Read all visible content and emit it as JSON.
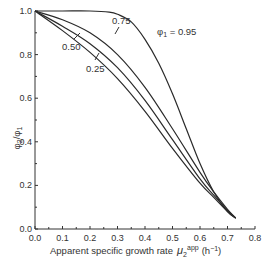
{
  "chart_data": {
    "type": "line",
    "title": "",
    "xlabel": "Apparent specific growth rate μ2^app (h^-1)",
    "xlabel_main": "Apparent specific growth rate",
    "xlabel_symbol": "μ",
    "xlabel_sub": "2",
    "xlabel_sup": "app",
    "xlabel_units": "(h",
    "xlabel_units_sup": "−1",
    "xlabel_units_close": ")",
    "ylabel": "φ2/φ1",
    "ylabel_main": "φ",
    "ylabel_sub1": "2",
    "ylabel_slash": "/φ",
    "ylabel_sub2": "1",
    "xlim": [
      0.0,
      0.8
    ],
    "ylim": [
      0.0,
      1.0
    ],
    "x_ticks": [
      "0.0",
      "0.1",
      "0.2",
      "0.3",
      "0.4",
      "0.5",
      "0.6",
      "0.7",
      "0.8"
    ],
    "y_ticks": [
      "0.0",
      "0.2",
      "0.4",
      "0.6",
      "0.8",
      "1.0"
    ],
    "grid": false,
    "legend": "inline annotations",
    "series": [
      {
        "name": "φ1 = 0.95",
        "label": "φ1 = 0.95",
        "x": [
          0.0,
          0.1,
          0.2,
          0.27,
          0.3,
          0.35,
          0.4,
          0.45,
          0.5,
          0.55,
          0.6,
          0.65,
          0.7,
          0.73
        ],
        "y": [
          1.0,
          1.0,
          1.0,
          0.995,
          0.985,
          0.95,
          0.87,
          0.76,
          0.62,
          0.46,
          0.3,
          0.17,
          0.08,
          0.05
        ]
      },
      {
        "name": "φ1 = 0.75",
        "label": "0.75",
        "x": [
          0.0,
          0.1,
          0.2,
          0.3,
          0.4,
          0.5,
          0.6,
          0.65,
          0.7,
          0.73
        ],
        "y": [
          1.0,
          0.96,
          0.9,
          0.8,
          0.65,
          0.46,
          0.26,
          0.17,
          0.09,
          0.05
        ]
      },
      {
        "name": "φ1 = 0.50",
        "label": "0.50",
        "x": [
          0.0,
          0.1,
          0.2,
          0.3,
          0.4,
          0.5,
          0.6,
          0.65,
          0.7,
          0.73
        ],
        "y": [
          1.0,
          0.93,
          0.85,
          0.74,
          0.59,
          0.41,
          0.23,
          0.155,
          0.085,
          0.05
        ]
      },
      {
        "name": "φ1 = 0.25",
        "label": "0.25",
        "x": [
          0.0,
          0.1,
          0.2,
          0.3,
          0.4,
          0.5,
          0.6,
          0.65,
          0.7,
          0.73
        ],
        "y": [
          1.0,
          0.91,
          0.81,
          0.69,
          0.54,
          0.37,
          0.21,
          0.145,
          0.08,
          0.05
        ]
      }
    ],
    "annotations": [
      {
        "text": "φ1 = 0.95",
        "x": 0.49,
        "y": 0.93
      },
      {
        "text": "0.75",
        "x": 0.28,
        "y": 0.97
      },
      {
        "text": "0.50",
        "x": 0.1,
        "y": 0.8
      },
      {
        "text": "0.25",
        "x": 0.22,
        "y": 0.73
      }
    ]
  },
  "labels": {
    "phi_sym": "φ",
    "phi_sub": "1",
    "phi_eq": " = 0.95",
    "l075": "0.75",
    "l050": "0.50",
    "l025": "0.25"
  }
}
